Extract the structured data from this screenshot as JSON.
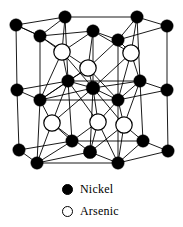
{
  "figure": {
    "background_color": "#ffffff",
    "bond_color": "#000000",
    "nickel_color": "#000000",
    "arsenic_fill_color": "#ffffff",
    "arsenic_outline_color": "#000000"
  },
  "legend": {
    "items": [
      {
        "label": "Nickel",
        "marker": "filled-circle-icon",
        "color": "#000000"
      },
      {
        "label": "Arsenic",
        "marker": "open-circle-icon",
        "color": "#ffffff"
      }
    ]
  },
  "structure": {
    "nickel_atoms": [
      {
        "id": "ni-t1",
        "x": 16,
        "y": 25,
        "r": 6.2
      },
      {
        "id": "ni-t2",
        "x": 65,
        "y": 17,
        "r": 6.2
      },
      {
        "id": "ni-t3",
        "x": 137,
        "y": 17,
        "r": 6.2
      },
      {
        "id": "ni-t4",
        "x": 167,
        "y": 26,
        "r": 6.2
      },
      {
        "id": "ni-t5",
        "x": 40,
        "y": 36,
        "r": 6.2
      },
      {
        "id": "ni-t6",
        "x": 93,
        "y": 31,
        "r": 6.2
      },
      {
        "id": "ni-t7",
        "x": 118,
        "y": 40,
        "r": 6.2
      },
      {
        "id": "ni-m1",
        "x": 17,
        "y": 90,
        "r": 6.2
      },
      {
        "id": "ni-m2",
        "x": 68,
        "y": 81,
        "r": 6.2
      },
      {
        "id": "ni-m3",
        "x": 140,
        "y": 81,
        "r": 6.2
      },
      {
        "id": "ni-m4",
        "x": 167,
        "y": 90,
        "r": 6.2
      },
      {
        "id": "ni-m5",
        "x": 40,
        "y": 100,
        "r": 6.2
      },
      {
        "id": "ni-m6",
        "x": 93,
        "y": 88,
        "r": 6.8
      },
      {
        "id": "ni-m7",
        "x": 118,
        "y": 100,
        "r": 6.2
      },
      {
        "id": "ni-b1",
        "x": 19,
        "y": 150,
        "r": 6.2
      },
      {
        "id": "ni-b2",
        "x": 72,
        "y": 141,
        "r": 6.2
      },
      {
        "id": "ni-b3",
        "x": 143,
        "y": 141,
        "r": 6.2
      },
      {
        "id": "ni-b4",
        "x": 168,
        "y": 151,
        "r": 6.2
      },
      {
        "id": "ni-b5",
        "x": 37,
        "y": 163,
        "r": 6.2
      },
      {
        "id": "ni-b6",
        "x": 90,
        "y": 152,
        "r": 6.6
      },
      {
        "id": "ni-b7",
        "x": 118,
        "y": 163,
        "r": 6.2
      }
    ],
    "arsenic_atoms": [
      {
        "id": "as-u1",
        "x": 62,
        "y": 52,
        "r": 8.2
      },
      {
        "id": "as-u2",
        "x": 131,
        "y": 53,
        "r": 8.2
      },
      {
        "id": "as-u3",
        "x": 88,
        "y": 68,
        "r": 8.2
      },
      {
        "id": "as-l1",
        "x": 52,
        "y": 123,
        "r": 8.2
      },
      {
        "id": "as-l2",
        "x": 98,
        "y": 122,
        "r": 8.2
      },
      {
        "id": "as-l3",
        "x": 124,
        "y": 125,
        "r": 8.2
      }
    ],
    "bonds": [
      [
        "ni-t1",
        "ni-t2"
      ],
      [
        "ni-t2",
        "ni-t3"
      ],
      [
        "ni-t3",
        "ni-t4"
      ],
      [
        "ni-t1",
        "ni-t5"
      ],
      [
        "ni-t5",
        "ni-t6"
      ],
      [
        "ni-t6",
        "ni-t7"
      ],
      [
        "ni-t7",
        "ni-t4"
      ],
      [
        "ni-t2",
        "ni-t5"
      ],
      [
        "ni-t3",
        "ni-t7"
      ],
      [
        "ni-t1",
        "ni-t5"
      ],
      [
        "ni-t1",
        "ni-m1"
      ],
      [
        "ni-t2",
        "ni-m2"
      ],
      [
        "ni-t3",
        "ni-m3"
      ],
      [
        "ni-t4",
        "ni-m4"
      ],
      [
        "ni-t5",
        "ni-m5"
      ],
      [
        "ni-t6",
        "ni-m6"
      ],
      [
        "ni-t7",
        "ni-m7"
      ],
      [
        "ni-t5",
        "as-u1"
      ],
      [
        "ni-t2",
        "as-u1"
      ],
      [
        "ni-t6",
        "as-u1"
      ],
      [
        "ni-t6",
        "as-u2"
      ],
      [
        "ni-t3",
        "as-u2"
      ],
      [
        "ni-t7",
        "as-u2"
      ],
      [
        "ni-t6",
        "as-u3"
      ],
      [
        "ni-t7",
        "as-u3"
      ],
      [
        "ni-t5",
        "as-u3"
      ],
      [
        "as-u1",
        "ni-m2"
      ],
      [
        "as-u1",
        "ni-m5"
      ],
      [
        "as-u1",
        "ni-m6"
      ],
      [
        "as-u2",
        "ni-m3"
      ],
      [
        "as-u2",
        "ni-m7"
      ],
      [
        "as-u2",
        "ni-m6"
      ],
      [
        "as-u3",
        "ni-m6"
      ],
      [
        "as-u3",
        "ni-m5"
      ],
      [
        "as-u3",
        "ni-m7"
      ],
      [
        "as-u3",
        "ni-m2"
      ],
      [
        "ni-m1",
        "ni-m2"
      ],
      [
        "ni-m2",
        "ni-m3"
      ],
      [
        "ni-m3",
        "ni-m4"
      ],
      [
        "ni-m1",
        "ni-m5"
      ],
      [
        "ni-m5",
        "ni-m6"
      ],
      [
        "ni-m6",
        "ni-m7"
      ],
      [
        "ni-m7",
        "ni-m4"
      ],
      [
        "ni-m2",
        "ni-m5"
      ],
      [
        "ni-m3",
        "ni-m7"
      ],
      [
        "ni-m5",
        "ni-m7"
      ],
      [
        "ni-m2",
        "ni-m6"
      ],
      [
        "ni-m3",
        "ni-m6"
      ],
      [
        "ni-m1",
        "ni-b1"
      ],
      [
        "ni-m2",
        "ni-b2"
      ],
      [
        "ni-m3",
        "ni-b3"
      ],
      [
        "ni-m4",
        "ni-b4"
      ],
      [
        "ni-m5",
        "ni-b5"
      ],
      [
        "ni-m6",
        "ni-b6"
      ],
      [
        "ni-m7",
        "ni-b7"
      ],
      [
        "ni-m5",
        "as-l1"
      ],
      [
        "ni-m2",
        "as-l1"
      ],
      [
        "ni-m6",
        "as-l1"
      ],
      [
        "ni-m6",
        "as-l2"
      ],
      [
        "ni-m2",
        "as-l2"
      ],
      [
        "ni-m7",
        "as-l2"
      ],
      [
        "ni-m6",
        "as-l3"
      ],
      [
        "ni-m3",
        "as-l3"
      ],
      [
        "ni-m7",
        "as-l3"
      ],
      [
        "as-l1",
        "ni-b2"
      ],
      [
        "as-l1",
        "ni-b5"
      ],
      [
        "as-l1",
        "ni-b6"
      ],
      [
        "as-l2",
        "ni-b6"
      ],
      [
        "as-l2",
        "ni-b2"
      ],
      [
        "as-l2",
        "ni-b7"
      ],
      [
        "as-l3",
        "ni-b7"
      ],
      [
        "as-l3",
        "ni-b3"
      ],
      [
        "as-l3",
        "ni-b6"
      ],
      [
        "ni-b1",
        "ni-b2"
      ],
      [
        "ni-b2",
        "ni-b3"
      ],
      [
        "ni-b3",
        "ni-b4"
      ],
      [
        "ni-b1",
        "ni-b5"
      ],
      [
        "ni-b5",
        "ni-b6"
      ],
      [
        "ni-b6",
        "ni-b7"
      ],
      [
        "ni-b7",
        "ni-b4"
      ],
      [
        "ni-b2",
        "ni-b5"
      ],
      [
        "ni-b3",
        "ni-b7"
      ],
      [
        "ni-b5",
        "ni-b7"
      ]
    ]
  }
}
